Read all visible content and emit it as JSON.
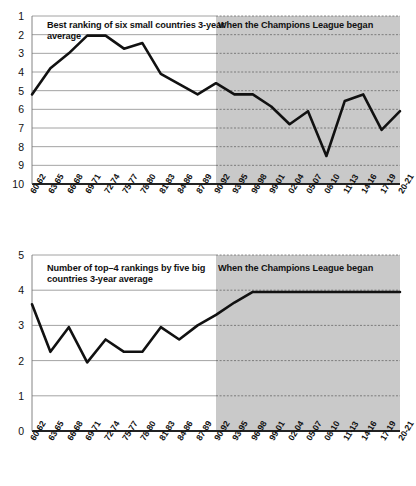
{
  "figure": {
    "shade_label": "When the Champions League began",
    "shade_color": "#c9c9c9",
    "line_color": "#111111",
    "grid_color": "#8c8c8c",
    "axis_color": "#333333",
    "background": "#ffffff"
  },
  "chart_data": [
    {
      "type": "line",
      "title": "Best ranking of six small countries 3-year average",
      "xlabel": "",
      "ylabel": "",
      "y_inverted": true,
      "ylim": [
        1,
        10
      ],
      "yticks": [
        1,
        2,
        3,
        4,
        5,
        6,
        7,
        8,
        9,
        10
      ],
      "grid": true,
      "legend": "none",
      "annotations": [
        {
          "text": "Best ranking of six small countries 3-year average",
          "position": "top-left"
        },
        {
          "text": "When the Champions League began",
          "position": "top-right",
          "region": "shaded"
        }
      ],
      "shaded_region": {
        "from": "90-62",
        "start_category": "90-92",
        "label": "When the Champions League began"
      },
      "categories": [
        "60-62",
        "63-65",
        "66-68",
        "69-71",
        "72-74",
        "75-77",
        "78-80",
        "81-83",
        "84-86",
        "87-89",
        "90-92",
        "93-95",
        "96-98",
        "99-01",
        "02-04",
        "05-07",
        "08-10",
        "11-13",
        "14-16",
        "17-19",
        "20-21"
      ],
      "values": [
        5.2,
        3.8,
        3.0,
        2.05,
        2.05,
        2.75,
        2.45,
        4.1,
        4.65,
        5.2,
        4.6,
        5.2,
        5.2,
        5.85,
        6.8,
        6.1,
        8.5,
        5.55,
        5.2,
        7.1,
        6.1
      ]
    },
    {
      "type": "line",
      "title": "Number of top–4 rankings by five big countries 3-year average",
      "xlabel": "",
      "ylabel": "",
      "y_inverted": false,
      "ylim": [
        0,
        5
      ],
      "yticks": [
        0,
        1,
        2,
        3,
        4,
        5
      ],
      "grid": true,
      "legend": "none",
      "annotations": [
        {
          "text": "Number of top–4 rankings by five big countries 3-year average",
          "position": "top-left"
        },
        {
          "text": "When the Champions League began",
          "position": "top-right",
          "region": "shaded"
        }
      ],
      "shaded_region": {
        "start_category": "90-92",
        "label": "When the Champions League began"
      },
      "categories": [
        "60-62",
        "63-65",
        "66-68",
        "69-71",
        "72-74",
        "75-77",
        "78-80",
        "81-83",
        "84-86",
        "87-89",
        "90-92",
        "93-95",
        "96-98",
        "99-01",
        "02-04",
        "05-07",
        "08-10",
        "11-13",
        "14-16",
        "17-19",
        "20-21"
      ],
      "values": [
        3.6,
        2.25,
        2.95,
        1.95,
        2.6,
        2.25,
        2.25,
        2.95,
        2.6,
        3.0,
        3.3,
        3.65,
        3.95,
        3.95,
        3.95,
        3.95,
        3.95,
        3.95,
        3.95,
        3.95,
        3.95
      ]
    }
  ]
}
